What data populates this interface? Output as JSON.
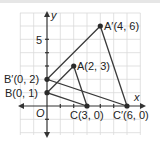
{
  "diagram": {
    "type": "coordinate-plane-dilation",
    "axes": {
      "x_label": "x",
      "y_label": "y",
      "origin_label": "O",
      "y_tick_label": "5"
    },
    "points": [
      {
        "name": "A",
        "label": "A(2, 3)",
        "x": 2,
        "y": 3
      },
      {
        "name": "B",
        "label": "B(0, 1)",
        "x": 0,
        "y": 1
      },
      {
        "name": "C",
        "label": "C(3, 0)",
        "x": 3,
        "y": 0
      },
      {
        "name": "A'",
        "label": "A′(4, 6)",
        "x": 4,
        "y": 6
      },
      {
        "name": "B'",
        "label": "B′(0, 2)",
        "x": 0,
        "y": 2
      },
      {
        "name": "C'",
        "label": "C′(6, 0)",
        "x": 6,
        "y": 0
      }
    ],
    "triangles": [
      {
        "name": "ABC",
        "vertices": [
          "A",
          "B",
          "C"
        ]
      },
      {
        "name": "A'B'C'",
        "vertices": [
          "A'",
          "B'",
          "C'"
        ]
      }
    ],
    "colors": {
      "grid": "#d9d9d9",
      "axis": "#333333",
      "lines": "#3a3a3a",
      "points": "#2b2b2b"
    }
  }
}
